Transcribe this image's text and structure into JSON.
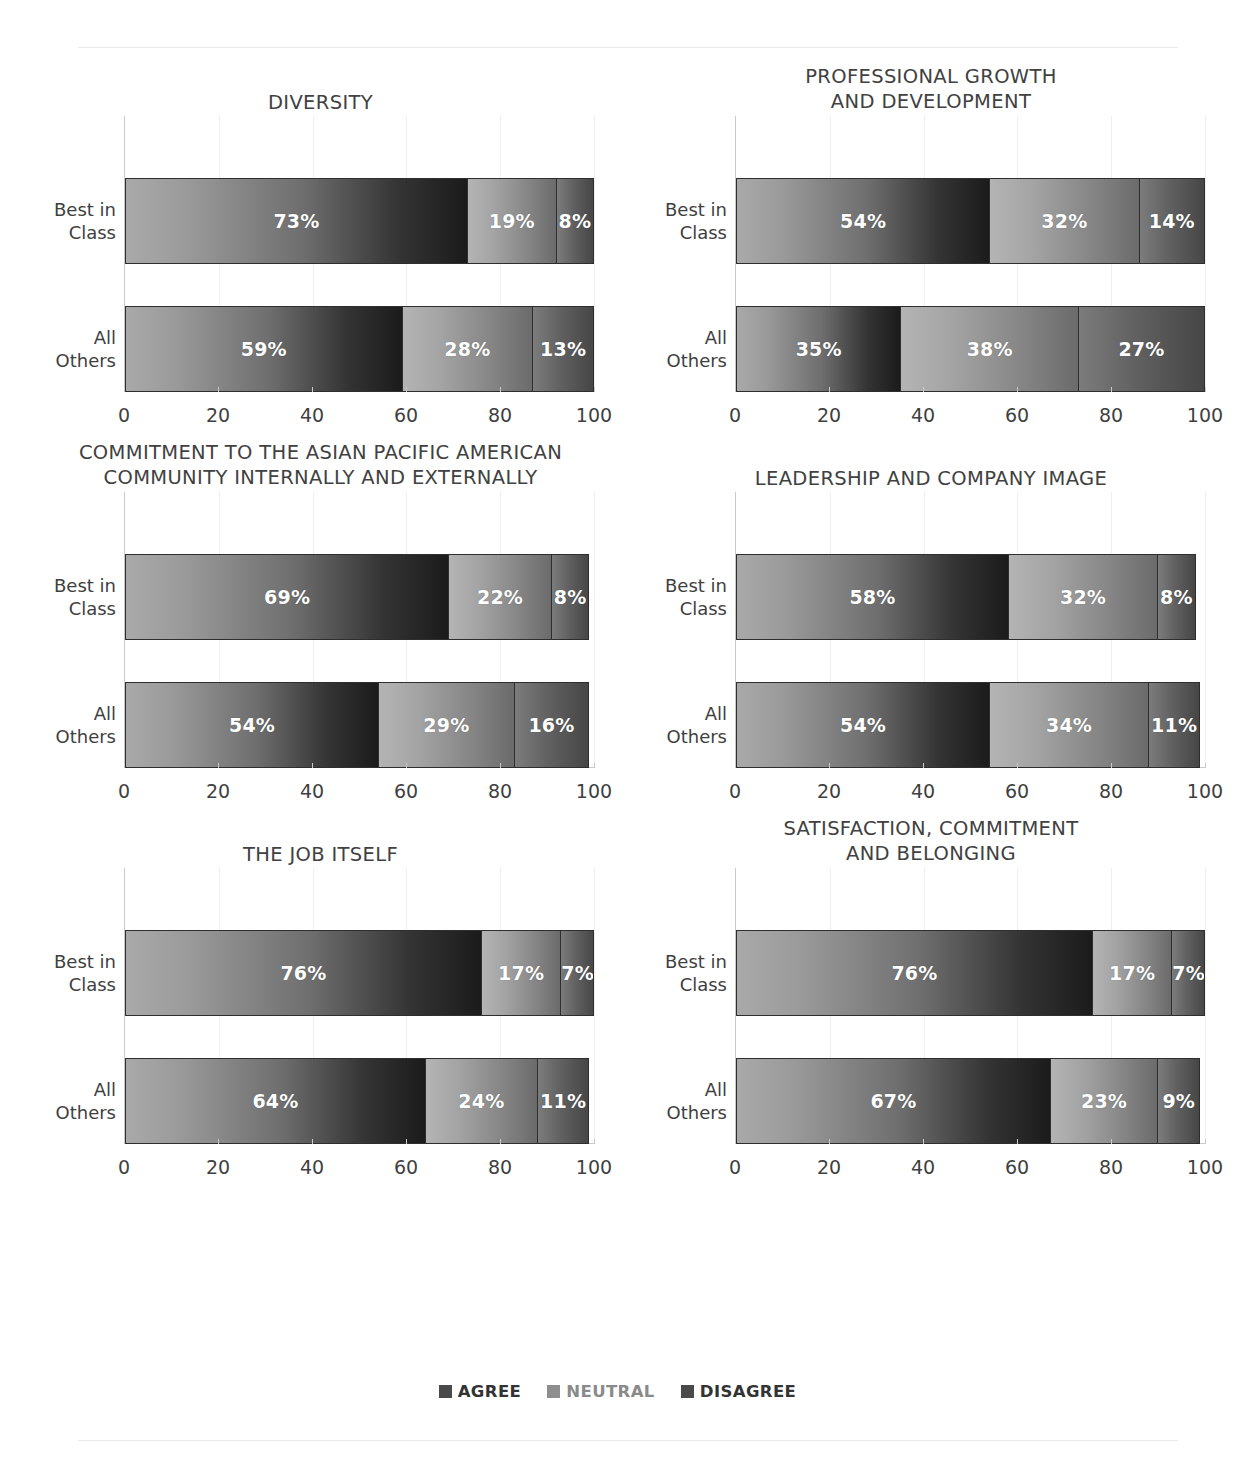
{
  "legend": {
    "items": [
      {
        "label": "AGREE",
        "swatch_color": "#4a4a4a",
        "text_color": "#333333"
      },
      {
        "label": "NEUTRAL",
        "swatch_color": "#8e8e8e",
        "text_color": "#8a8a8a"
      },
      {
        "label": "DISAGREE",
        "swatch_color": "#4a4a4a",
        "text_color": "#333333"
      }
    ]
  },
  "axis": {
    "ticks": [
      "0",
      "20",
      "40",
      "60",
      "80",
      "100"
    ],
    "min": 0,
    "max": 100
  },
  "categories": [
    "Best in\nClass",
    "All\nOthers"
  ],
  "chart_data": [
    {
      "type": "bar",
      "title": "DIVERSITY",
      "subtype": "stacked-horizontal-100",
      "categories": [
        "Best in Class",
        "All Others"
      ],
      "series": [
        {
          "name": "AGREE",
          "values": [
            73,
            59
          ]
        },
        {
          "name": "NEUTRAL",
          "values": [
            19,
            28
          ]
        },
        {
          "name": "DISAGREE",
          "values": [
            8,
            13
          ]
        }
      ],
      "data_labels": [
        [
          "73%",
          "19%",
          "8%"
        ],
        [
          "59%",
          "28%",
          "13%"
        ]
      ],
      "xlabel": "",
      "ylabel": "",
      "xlim": [
        0,
        100
      ],
      "xticks": [
        0,
        20,
        40,
        60,
        80,
        100
      ],
      "grid": true,
      "legend_position": "bottom"
    },
    {
      "type": "bar",
      "title": "PROFESSIONAL GROWTH\nAND DEVELOPMENT",
      "subtype": "stacked-horizontal-100",
      "categories": [
        "Best in Class",
        "All Others"
      ],
      "series": [
        {
          "name": "AGREE",
          "values": [
            54,
            35
          ]
        },
        {
          "name": "NEUTRAL",
          "values": [
            32,
            38
          ]
        },
        {
          "name": "DISAGREE",
          "values": [
            14,
            27
          ]
        }
      ],
      "data_labels": [
        [
          "54%",
          "32%",
          "14%"
        ],
        [
          "35%",
          "38%",
          "27%"
        ]
      ],
      "xlabel": "",
      "ylabel": "",
      "xlim": [
        0,
        100
      ],
      "xticks": [
        0,
        20,
        40,
        60,
        80,
        100
      ],
      "grid": true,
      "legend_position": "bottom"
    },
    {
      "type": "bar",
      "title": "COMMITMENT TO THE ASIAN PACIFIC AMERICAN\nCOMMUNITY INTERNALLY AND EXTERNALLY",
      "subtype": "stacked-horizontal-100",
      "categories": [
        "Best in Class",
        "All Others"
      ],
      "series": [
        {
          "name": "AGREE",
          "values": [
            69,
            54
          ]
        },
        {
          "name": "NEUTRAL",
          "values": [
            22,
            29
          ]
        },
        {
          "name": "DISAGREE",
          "values": [
            8,
            16
          ]
        }
      ],
      "data_labels": [
        [
          "69%",
          "22%",
          "8%"
        ],
        [
          "54%",
          "29%",
          "16%"
        ]
      ],
      "xlabel": "",
      "ylabel": "",
      "xlim": [
        0,
        100
      ],
      "xticks": [
        0,
        20,
        40,
        60,
        80,
        100
      ],
      "grid": true,
      "legend_position": "bottom"
    },
    {
      "type": "bar",
      "title": "LEADERSHIP AND COMPANY IMAGE",
      "subtype": "stacked-horizontal-100",
      "categories": [
        "Best in Class",
        "All Others"
      ],
      "series": [
        {
          "name": "AGREE",
          "values": [
            58,
            54
          ]
        },
        {
          "name": "NEUTRAL",
          "values": [
            32,
            34
          ]
        },
        {
          "name": "DISAGREE",
          "values": [
            8,
            11
          ]
        }
      ],
      "data_labels": [
        [
          "58%",
          "32%",
          "8%"
        ],
        [
          "54%",
          "34%",
          "11%"
        ]
      ],
      "xlabel": "",
      "ylabel": "",
      "xlim": [
        0,
        100
      ],
      "xticks": [
        0,
        20,
        40,
        60,
        80,
        100
      ],
      "grid": true,
      "legend_position": "bottom"
    },
    {
      "type": "bar",
      "title": "THE JOB ITSELF",
      "subtype": "stacked-horizontal-100",
      "categories": [
        "Best in Class",
        "All Others"
      ],
      "series": [
        {
          "name": "AGREE",
          "values": [
            76,
            64
          ]
        },
        {
          "name": "NEUTRAL",
          "values": [
            17,
            24
          ]
        },
        {
          "name": "DISAGREE",
          "values": [
            7,
            11
          ]
        }
      ],
      "data_labels": [
        [
          "76%",
          "17%",
          "7%"
        ],
        [
          "64%",
          "24%",
          "11%"
        ]
      ],
      "xlabel": "",
      "ylabel": "",
      "xlim": [
        0,
        100
      ],
      "xticks": [
        0,
        20,
        40,
        60,
        80,
        100
      ],
      "grid": true,
      "legend_position": "bottom"
    },
    {
      "type": "bar",
      "title": "SATISFACTION, COMMITMENT\nAND BELONGING",
      "subtype": "stacked-horizontal-100",
      "categories": [
        "Best in Class",
        "All Others"
      ],
      "series": [
        {
          "name": "AGREE",
          "values": [
            76,
            67
          ]
        },
        {
          "name": "NEUTRAL",
          "values": [
            17,
            23
          ]
        },
        {
          "name": "DISAGREE",
          "values": [
            7,
            9
          ]
        }
      ],
      "data_labels": [
        [
          "76%",
          "17%",
          "7%"
        ],
        [
          "67%",
          "23%",
          "9%"
        ]
      ],
      "xlabel": "",
      "ylabel": "",
      "xlim": [
        0,
        100
      ],
      "xticks": [
        0,
        20,
        40,
        60,
        80,
        100
      ],
      "grid": true,
      "legend_position": "bottom"
    }
  ]
}
